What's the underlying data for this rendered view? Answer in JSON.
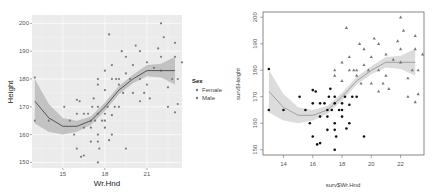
{
  "chart_data": [
    {
      "type": "scatter",
      "style": "ggplot2",
      "title": "",
      "xlabel": "Wr.Hnd",
      "ylabel": "Height",
      "xlim": [
        12.8,
        23.5
      ],
      "ylim": [
        148,
        203
      ],
      "xticks": [
        15,
        18,
        21
      ],
      "yticks": [
        150,
        160,
        170,
        180,
        190,
        200
      ],
      "grid": true,
      "legend": {
        "title": "Sex",
        "position": "right",
        "entries": [
          "Female",
          "Male"
        ]
      },
      "smooth": {
        "x": [
          13.0,
          14.0,
          15.0,
          16.0,
          17.0,
          18.0,
          19.0,
          20.0,
          21.0,
          22.0,
          23.0
        ],
        "y": [
          172,
          166,
          163,
          163,
          165,
          170,
          176,
          180,
          183,
          183,
          183
        ],
        "lower": [
          164,
          161,
          160,
          161,
          163.5,
          168.5,
          174.5,
          178.5,
          181,
          180.5,
          178
        ],
        "upper": [
          180,
          171,
          166,
          165,
          166.5,
          171.5,
          177.5,
          181.5,
          185,
          185.5,
          188
        ]
      },
      "series": [
        {
          "name": "Female",
          "points": [
            [
              13,
              165
            ],
            [
              13,
              180.5
            ],
            [
              14,
              165
            ],
            [
              15.1,
              170
            ],
            [
              15.5,
              165
            ],
            [
              15.8,
              160
            ],
            [
              16,
              172.5
            ],
            [
              16,
              167.5
            ],
            [
              16,
              155
            ],
            [
              16.2,
              172
            ],
            [
              16.5,
              167.5
            ],
            [
              16.5,
              162.5
            ],
            [
              16.5,
              152.5
            ],
            [
              16.8,
              167.5
            ],
            [
              17,
              165
            ],
            [
              17,
              162.5
            ],
            [
              17,
              157.5
            ],
            [
              17.1,
              170
            ],
            [
              17.3,
              165
            ],
            [
              17.5,
              167.5
            ],
            [
              17.5,
              160
            ],
            [
              17.5,
              157.5
            ],
            [
              17.5,
              150
            ],
            [
              17.5,
              170
            ],
            [
              17.8,
              165
            ],
            [
              18,
              167.5
            ],
            [
              18,
              162.5
            ],
            [
              18,
              165
            ],
            [
              18.2,
              170
            ],
            [
              18.5,
              167
            ],
            [
              18.5,
              160
            ],
            [
              18.7,
              170
            ],
            [
              19,
              170
            ],
            [
              19.5,
              155
            ],
            [
              16.3,
              152
            ],
            [
              17.6,
              155
            ],
            [
              18.3,
              158
            ],
            [
              17.2,
              173
            ]
          ]
        },
        {
          "name": "Male",
          "points": [
            [
              17.5,
              180
            ],
            [
              17.5,
              178
            ],
            [
              18,
              183
            ],
            [
              18,
              176
            ],
            [
              18.3,
              196
            ],
            [
              18.5,
              180
            ],
            [
              18.5,
              185
            ],
            [
              19,
              180
            ],
            [
              19,
              178
            ],
            [
              19.2,
              190
            ],
            [
              19.5,
              188
            ],
            [
              19.5,
              182
            ],
            [
              19.8,
              180
            ],
            [
              20,
              185
            ],
            [
              20,
              175
            ],
            [
              20.2,
              192
            ],
            [
              20.5,
              190
            ],
            [
              20.5,
              180
            ],
            [
              20.5,
              172
            ],
            [
              20.8,
              175
            ],
            [
              21,
              178
            ],
            [
              21,
              186
            ],
            [
              21.2,
              173
            ],
            [
              21.5,
              184
            ],
            [
              21.8,
              191
            ],
            [
              22,
              200
            ],
            [
              22,
              188
            ],
            [
              22,
              183
            ],
            [
              22.2,
              195
            ],
            [
              22.5,
              177
            ],
            [
              22.5,
              170
            ],
            [
              22.8,
              180
            ],
            [
              23,
              193
            ],
            [
              23,
              188
            ],
            [
              23,
              168
            ],
            [
              23.2,
              180
            ],
            [
              23.2,
              171
            ],
            [
              23.5,
              186
            ],
            [
              18.8,
              180
            ],
            [
              19.3,
              175
            ]
          ]
        }
      ]
    },
    {
      "type": "scatter",
      "style": "base-r",
      "title": "",
      "xlabel": "surv$Wr.Hnd",
      "ylabel": "surv$Height",
      "xlim": [
        12.6,
        23.6
      ],
      "ylim": [
        148,
        202
      ],
      "xticks": [
        14,
        16,
        18,
        20,
        22
      ],
      "yticks": [
        150,
        160,
        170,
        180,
        190,
        200
      ],
      "grid": false,
      "series_markers": {
        "Female": "filled-circle",
        "Male": "triangle"
      }
    }
  ],
  "left_chart": {
    "xlabel": "Wr.Hnd",
    "ylabel": "Height",
    "xtick_labels": [
      "15",
      "18",
      "21"
    ],
    "ytick_labels": [
      "150",
      "160",
      "170",
      "180",
      "190",
      "200"
    ],
    "legend": {
      "title": "Sex",
      "items": [
        "Female",
        "Male"
      ]
    }
  },
  "right_chart": {
    "xlabel": "surv$Wr.Hnd",
    "ylabel": "surv$Height",
    "xtick_labels": [
      "14",
      "16",
      "18",
      "20",
      "22"
    ],
    "ytick_labels": [
      "150",
      "160",
      "170",
      "180",
      "190",
      "200"
    ]
  },
  "colors": {
    "panel_bg": "#ebebeb",
    "grid": "#ffffff",
    "point": "#7a7a7a",
    "point_dark": "#111111",
    "triangle": "#777777",
    "smooth_line": "#555555",
    "ribbon": "#b4b4b4"
  }
}
